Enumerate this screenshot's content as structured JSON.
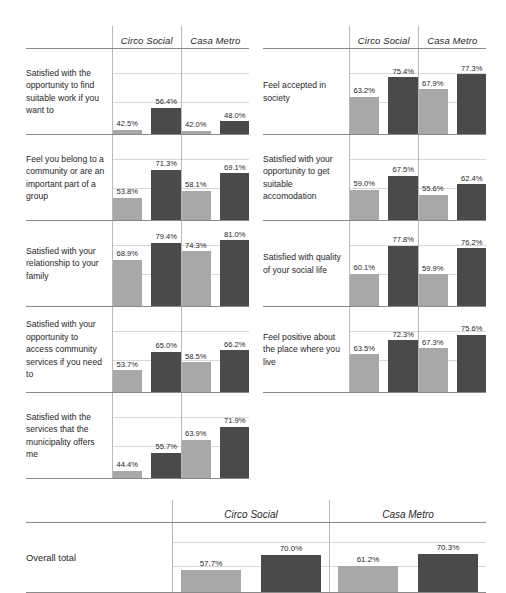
{
  "series": [
    {
      "key": "circo",
      "label": "Circo Social",
      "tone": "light"
    },
    {
      "key": "casa",
      "label": "Casa Metro",
      "tone": "dark"
    }
  ],
  "legend": {
    "light_swatch_color": "#a8a8a8",
    "dark_swatch_color": "#4a4a4a"
  },
  "columns": {
    "circo_social": "Circo Social",
    "casa_metro": "Casa Metro"
  },
  "total_row_label": "Overall total",
  "chart_data": {
    "type": "bar",
    "title": "",
    "xlabel": "",
    "ylabel": "",
    "ylim": [
      40,
      85
    ],
    "grid": true,
    "legend_position": "column-headers",
    "value_format": "percent-one-decimal",
    "panel_columns": [
      "Circo Social",
      "Casa Metro"
    ],
    "bar_series": [
      "light",
      "dark"
    ],
    "panels_left": [
      {
        "category": "Satisfied with the opportunity to find suitable work if you want to",
        "groups": [
          {
            "column": "Circo Social",
            "light": 42.5,
            "dark": 56.4,
            "light_label": "42.5%",
            "dark_label": "56.4%"
          },
          {
            "column": "Casa Metro",
            "light": 42.0,
            "dark": 48.0,
            "light_label": "42.0%",
            "dark_label": "48.0%"
          }
        ]
      },
      {
        "category": "Feel you belong to a community or are an important part of a group",
        "groups": [
          {
            "column": "Circo Social",
            "light": 53.8,
            "dark": 71.3,
            "light_label": "53.8%",
            "dark_label": "71.3%"
          },
          {
            "column": "Casa Metro",
            "light": 58.1,
            "dark": 69.1,
            "light_label": "58.1%",
            "dark_label": "69.1%"
          }
        ]
      },
      {
        "category": "Satisfied with your relationship to your family",
        "groups": [
          {
            "column": "Circo Social",
            "light": 68.9,
            "dark": 79.4,
            "light_label": "68.9%",
            "dark_label": "79.4%"
          },
          {
            "column": "Casa Metro",
            "light": 74.3,
            "dark": 81.0,
            "light_label": "74.3%",
            "dark_label": "81.0%"
          }
        ]
      },
      {
        "category": "Satisfied with your opportunity to access community services if you need to",
        "groups": [
          {
            "column": "Circo Social",
            "light": 53.7,
            "dark": 65.0,
            "light_label": "53.7%",
            "dark_label": "65.0%"
          },
          {
            "column": "Casa Metro",
            "light": 58.5,
            "dark": 66.2,
            "light_label": "58.5%",
            "dark_label": "66.2%"
          }
        ]
      },
      {
        "category": "Satisfied with the services that the municipality offers me",
        "groups": [
          {
            "column": "Circo Social",
            "light": 44.4,
            "dark": 55.7,
            "light_label": "44.4%",
            "dark_label": "55.7%"
          },
          {
            "column": "Casa Metro",
            "light": 63.9,
            "dark": 71.9,
            "light_label": "63.9%",
            "dark_label": "71.9%"
          }
        ]
      }
    ],
    "panels_right": [
      {
        "category": "Feel accepted in society",
        "groups": [
          {
            "column": "Circo Social",
            "light": 63.2,
            "dark": 75.4,
            "light_label": "63.2%",
            "dark_label": "75.4%"
          },
          {
            "column": "Casa Metro",
            "light": 67.9,
            "dark": 77.3,
            "light_label": "67.9%",
            "dark_label": "77.3%"
          }
        ]
      },
      {
        "category": "Satisfied with your opportunity to get suitable accomodation",
        "groups": [
          {
            "column": "Circo Social",
            "light": 59.0,
            "dark": 67.5,
            "light_label": "59.0%",
            "dark_label": "67.5%"
          },
          {
            "column": "Casa Metro",
            "light": 55.6,
            "dark": 62.4,
            "light_label": "55.6%",
            "dark_label": "62.4%"
          }
        ]
      },
      {
        "category": "Satisfied with quality of your social life",
        "groups": [
          {
            "column": "Circo Social",
            "light": 60.1,
            "dark": 77.8,
            "light_label": "60.1%",
            "dark_label": "77.8%"
          },
          {
            "column": "Casa Metro",
            "light": 59.9,
            "dark": 76.2,
            "light_label": "59.9%",
            "dark_label": "76.2%"
          }
        ]
      },
      {
        "category": "Feel positive about the place where you live",
        "groups": [
          {
            "column": "Circo Social",
            "light": 63.5,
            "dark": 72.3,
            "light_label": "63.5%",
            "dark_label": "72.3%"
          },
          {
            "column": "Casa Metro",
            "light": 67.3,
            "dark": 75.6,
            "light_label": "67.3%",
            "dark_label": "75.6%"
          }
        ]
      }
    ],
    "panel_total": {
      "category": "Overall total",
      "groups": [
        {
          "column": "Circo Social",
          "light": 57.7,
          "dark": 70.0,
          "light_label": "57.7%",
          "dark_label": "70.0%"
        },
        {
          "column": "Casa Metro",
          "light": 61.2,
          "dark": 70.3,
          "light_label": "61.2%",
          "dark_label": "70.3%"
        }
      ]
    }
  }
}
